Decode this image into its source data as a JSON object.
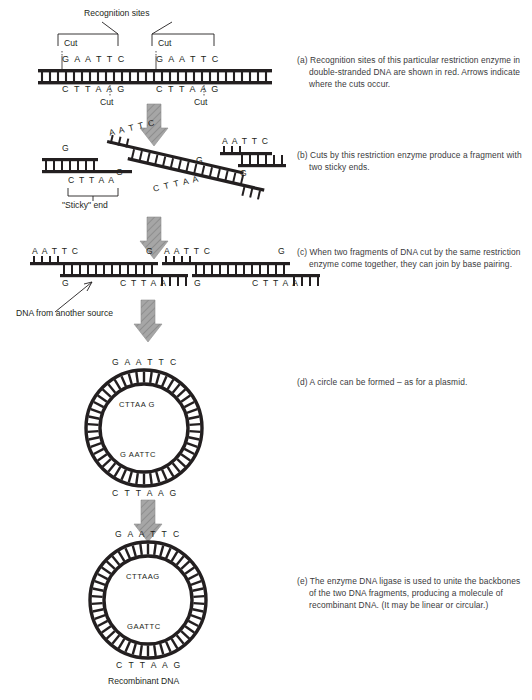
{
  "figure": {
    "title_label": "Recognition sites",
    "sticky_label": "\"Sticky\" end",
    "source_label": "DNA from another source",
    "result_label": "Recombinant DNA",
    "cut_label": "Cut",
    "arrow_color": "#9a9a9a",
    "ink_color": "#231f20",
    "caption_color": "#3a3a3c"
  },
  "panel_a": {
    "bracket_label": "Recognition sites",
    "cuts": [
      {
        "label": "Cut",
        "position": "top-left"
      },
      {
        "label": "Cut",
        "position": "top-right"
      },
      {
        "label": "Cut",
        "position": "bottom-left"
      },
      {
        "label": "Cut",
        "position": "bottom-right"
      }
    ],
    "site1_top": "G A A T T C",
    "site1_bottom": "C T T A A G",
    "site2_top": "G A A T T C",
    "site2_bottom": "C T T A A G"
  },
  "panel_b": {
    "left_fragment_top": "G",
    "left_fragment_bottom": "C T T A A",
    "middle_fragment_top": "A A T T C",
    "middle_fragment_bottom_left": "G",
    "middle_fragment_right": "G",
    "middle_fragment_bottom": "C T T A A",
    "right_fragment_top": "A A T T C",
    "right_fragment_bottom": "G",
    "sticky_end_label": "\"Sticky\" end"
  },
  "panel_c": {
    "frag1_top": "A A T T C",
    "frag1_top_right": "G",
    "frag1_bottom_left": "G",
    "frag1_bottom_right": "C T T A A",
    "frag2_top": "A A T T C",
    "frag2_top_right": "G",
    "frag2_bottom_left": "G",
    "frag2_bottom_right": "C T T A A",
    "source_annotation": "DNA from another source"
  },
  "panel_d": {
    "top_outer": "G A A T T C",
    "top_inner": "CTTAA G",
    "bottom_inner": "G AATTC",
    "bottom_outer": "C T T A A G"
  },
  "panel_e": {
    "top_outer": "G A A T T C",
    "top_inner": "CTTAAG",
    "bottom_inner": "GAATTC",
    "bottom_outer": "C T T A A G",
    "result_label": "Recombinant DNA"
  },
  "captions": [
    {
      "id": "a",
      "label": "(a)",
      "text": "Recognition sites of this particular restriction enzyme in double-stranded DNA are shown in red. Arrows indicate where the cuts occur."
    },
    {
      "id": "b",
      "label": "(b)",
      "text": "Cuts by this restriction enzyme produce a fragment with two sticky ends."
    },
    {
      "id": "c",
      "label": "(c)",
      "text": "When two fragments of DNA cut by the same restriction enzyme come together, they can join by base pairing."
    },
    {
      "id": "d",
      "label": "(d)",
      "text": "A circle can be formed – as for a plasmid."
    },
    {
      "id": "e",
      "label": "(e)",
      "text": "The enzyme DNA ligase is used to unite the backbones of the two DNA fragments, producing a molecule of recombinant DNA. (It may be linear or circular.)"
    }
  ]
}
